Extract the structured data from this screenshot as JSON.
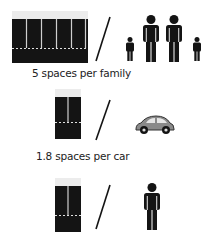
{
  "rows": [
    {
      "label": "5 spaces per family",
      "spaces": 5,
      "subject": "family",
      "subject_icon": "family-icon"
    },
    {
      "label": "1.8 spaces per car",
      "spaces": 1.8,
      "subject": "car",
      "subject_icon": "car-icon"
    },
    {
      "label": "",
      "spaces": 2,
      "subject": "person",
      "subject_icon": "person-icon"
    }
  ],
  "divider_glyph": "/",
  "colors": {
    "block": "#141414",
    "line": "#bfbfbf",
    "icon": "#141414",
    "car_body": "#8a8a8a"
  }
}
